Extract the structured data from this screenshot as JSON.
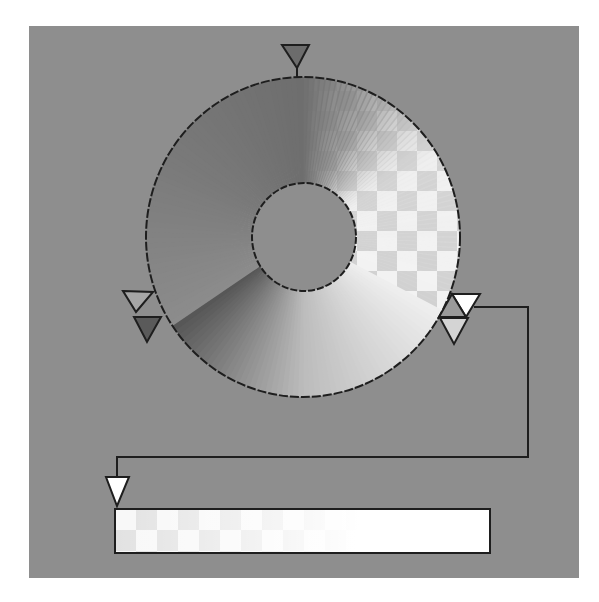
{
  "editor": {
    "title": "Conic gradient editor",
    "background_color": "#8e8e8e",
    "outline_color": "#1e1e1e"
  },
  "ring": {
    "start_angle_deg": 0,
    "stops": [
      {
        "angle_deg": 0,
        "color": "#6e6e6e",
        "opacity": 1.0
      },
      {
        "angle_deg": 25,
        "color": "#8a8a8a",
        "opacity": 0.75
      },
      {
        "angle_deg": 60,
        "color": "#e6e6e6",
        "opacity": 0.2
      },
      {
        "angle_deg": 118,
        "color": "#ffffff",
        "opacity": 0.05
      },
      {
        "angle_deg": 118,
        "color": "#efefef",
        "opacity": 1.0
      },
      {
        "angle_deg": 180,
        "color": "#bcbcbc",
        "opacity": 1.0
      },
      {
        "angle_deg": 236,
        "color": "#555555",
        "opacity": 1.0
      },
      {
        "angle_deg": 236,
        "color": "#8c8c8c",
        "opacity": 1.0
      },
      {
        "angle_deg": 300,
        "color": "#7a7a7a",
        "opacity": 1.0
      },
      {
        "angle_deg": 360,
        "color": "#6e6e6e",
        "opacity": 1.0
      }
    ]
  },
  "markers": [
    {
      "name": "top-stop-marker",
      "angle_deg": 0,
      "fill": "#6c6c6c",
      "selected": false
    },
    {
      "name": "left-outline-stop-marker",
      "angle_deg": 236,
      "fill": "#a6a6a6",
      "selected": false
    },
    {
      "name": "left-dark-stop-marker",
      "angle_deg": 236,
      "fill": "#5a5a5a",
      "selected": false
    },
    {
      "name": "right-white-stop-marker",
      "angle_deg": 118,
      "fill": "#ffffff",
      "selected": true
    },
    {
      "name": "right-light-stop-marker",
      "angle_deg": 118,
      "fill": "#d4d4d4",
      "selected": false
    }
  ],
  "preview_bar": {
    "marker_fill": "#ffffff",
    "start_opacity": 0.35,
    "end_opacity": 1.0,
    "color": "#ffffff"
  },
  "checker": {
    "light": "#f2f2f2",
    "dark": "#cfcfcf"
  }
}
